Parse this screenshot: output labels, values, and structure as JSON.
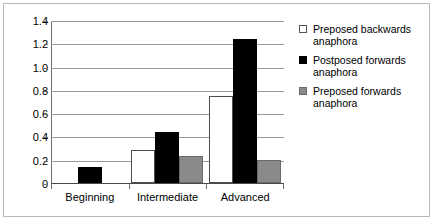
{
  "chart_data": {
    "type": "bar",
    "title": "",
    "xlabel": "",
    "ylabel": "",
    "categories": [
      "Beginning",
      "Intermediate",
      "Advanced"
    ],
    "series": [
      {
        "name": "Preposed backwards anaphora",
        "color": "#ffffff",
        "swatch": "white",
        "values": [
          0,
          0.28,
          0.745
        ]
      },
      {
        "name": "Postposed forwards anaphora",
        "color": "#000000",
        "swatch": "black",
        "values": [
          0.14,
          0.435,
          1.235
        ]
      },
      {
        "name": "Preposed forwards anaphora",
        "color": "#8a8a8a",
        "swatch": "gray",
        "values": [
          0,
          0.23,
          0.2
        ]
      }
    ],
    "ylim": [
      0,
      1.4
    ],
    "ytick_values": [
      0,
      0.2,
      0.4,
      0.6,
      0.8,
      1.0,
      1.2,
      1.4
    ],
    "ytick_labels": [
      "0",
      "0.2",
      "0.4",
      "0.6",
      "0.8",
      "1.0",
      "1.2",
      "1.4"
    ],
    "grid": true,
    "legend_position": "right"
  },
  "legend": {
    "items": [
      {
        "label_line1": "Preposed backwards",
        "label_line2": "anaphora",
        "swatch": "white"
      },
      {
        "label_line1": "Postposed forwards",
        "label_line2": "anaphora",
        "swatch": "black"
      },
      {
        "label_line1": "Preposed forwards",
        "label_line2": "anaphora",
        "swatch": "gray"
      }
    ]
  }
}
